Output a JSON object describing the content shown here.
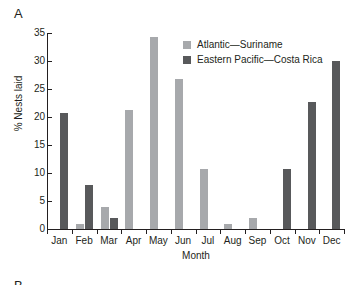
{
  "panel": {
    "label": "A",
    "next_label": "B"
  },
  "chart_data": {
    "type": "bar",
    "title": "A",
    "xlabel": "Month",
    "ylabel": "% Nests laid",
    "ylim": [
      0,
      35
    ],
    "yticks": [
      0,
      5,
      10,
      15,
      20,
      25,
      30,
      35
    ],
    "grid": false,
    "legend_position": "top-center-right",
    "categories": [
      "Jan",
      "Feb",
      "Mar",
      "Apr",
      "May",
      "Jun",
      "Jul",
      "Aug",
      "Sep",
      "Oct",
      "Nov",
      "Dec"
    ],
    "series": [
      {
        "name": "Atlantic—Suriname",
        "color": "#a7a9ac",
        "values": [
          0,
          0.9,
          3.9,
          21.3,
          34.2,
          26.7,
          10.8,
          0.9,
          1.9,
          0,
          0,
          0
        ]
      },
      {
        "name": "Eastern Pacific—Costa Rica",
        "color": "#58595b",
        "values": [
          20.8,
          7.8,
          1.9,
          0,
          0,
          0,
          0,
          0,
          0,
          10.8,
          22.7,
          30.0
        ]
      }
    ]
  }
}
